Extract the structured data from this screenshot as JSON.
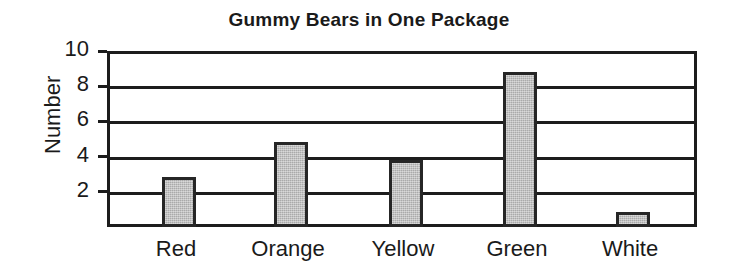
{
  "chart_data": {
    "type": "bar",
    "title": "Gummy Bears in One Package",
    "xlabel": "",
    "ylabel": "Number",
    "categories": [
      "Red",
      "Orange",
      "Yellow",
      "Green",
      "White"
    ],
    "values": [
      3,
      5,
      4,
      9,
      1
    ],
    "ylim": [
      0,
      10
    ],
    "ytick_labels": [
      "10",
      "8",
      "6",
      "4",
      "2"
    ],
    "ytick_values": [
      10,
      8,
      6,
      4,
      2
    ],
    "grid": "horizontal",
    "legend": "none",
    "bar_fill_color": "#b9b9b9",
    "bar_edge_color": "#262626",
    "axis_color": "#1c1c1c",
    "background_color": "#ffffff",
    "text_color": "#1a1a1a"
  },
  "geometry": {
    "plot_left": 107,
    "plot_top": 51,
    "plot_width": 590,
    "plot_height": 176,
    "bar_width": 34,
    "bar_centers": [
      176,
      288,
      403,
      517,
      630
    ]
  }
}
